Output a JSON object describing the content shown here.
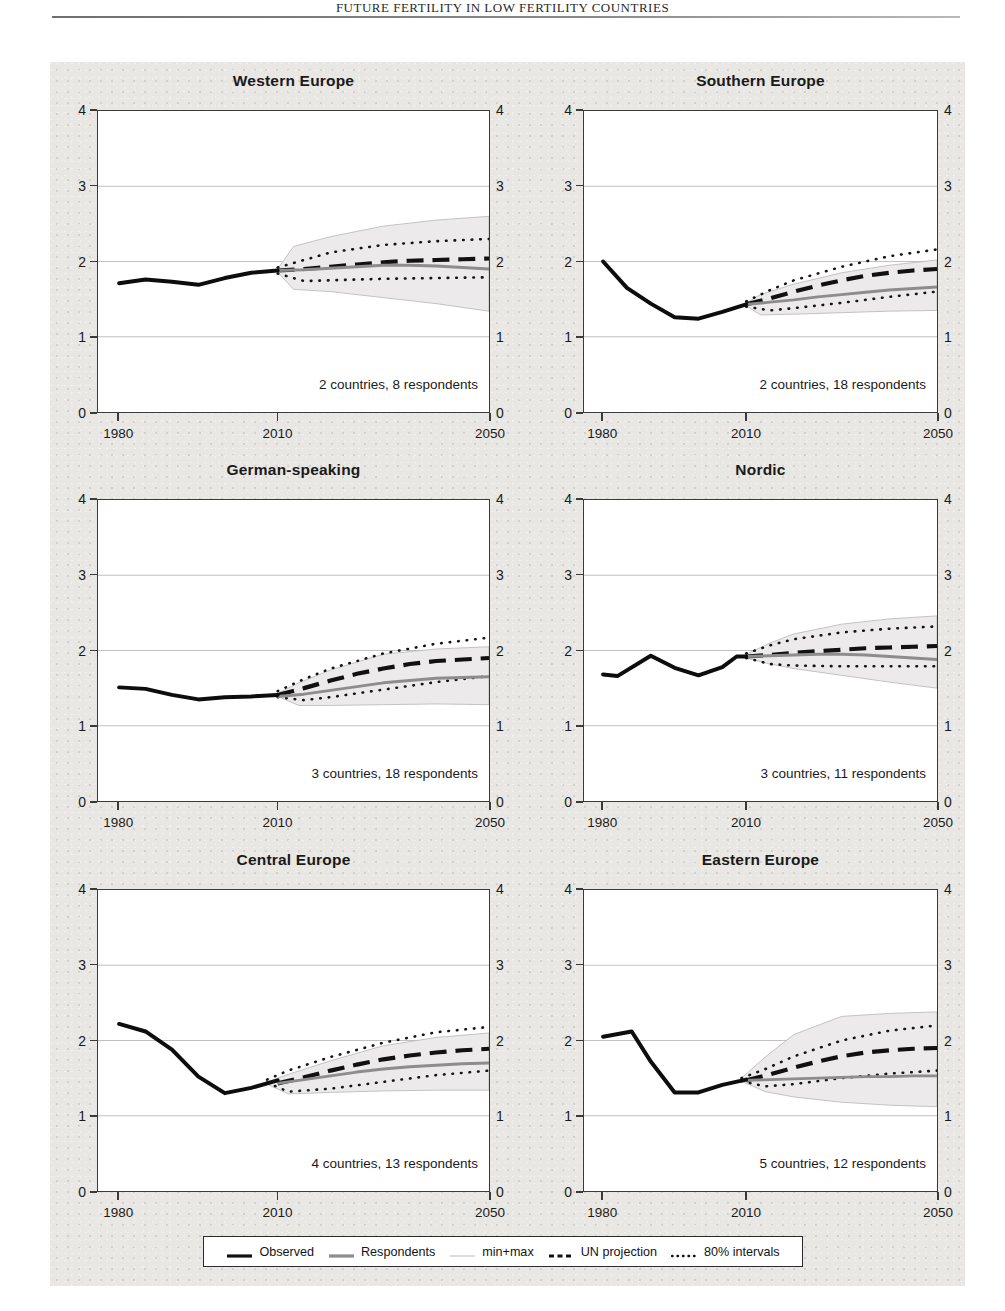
{
  "running_head": "FUTURE FERTILITY IN LOW FERTILITY COUNTRIES",
  "figure": {
    "background_color": "#e9e7e4",
    "plot_background": "#ffffff"
  },
  "axes": {
    "y_ticks": [
      "0",
      "1",
      "2",
      "3",
      "4"
    ],
    "y_values": [
      0,
      1,
      2,
      3,
      4
    ],
    "ylim": [
      0,
      4
    ],
    "x_ticks": [
      "1980",
      "2010",
      "2050"
    ],
    "x_values": [
      1980,
      2010,
      2050
    ],
    "xlim": [
      1976,
      2050
    ]
  },
  "legend": {
    "items": [
      {
        "label": "Observed",
        "key": "solid-thick-black",
        "color": "#111111"
      },
      {
        "label": "Respondents",
        "key": "solid-thick-gray",
        "color": "#8d8d8d"
      },
      {
        "label": "min+max",
        "key": "solid-thin-gray",
        "color": "#b9b9b9"
      },
      {
        "label": "UN projection",
        "key": "dashed-black",
        "color": "#111111"
      },
      {
        "label": "80% intervals",
        "key": "dotted-black",
        "color": "#111111"
      }
    ]
  },
  "chart_data": {
    "type": "line",
    "title": "",
    "xlabel": "",
    "ylabel": "",
    "xlim": [
      1976,
      2050
    ],
    "ylim": [
      0,
      4
    ],
    "grid": "horizontal gridlines at y = 1, 2, 3",
    "legend_position": "bottom-center",
    "panel_layout": "3 rows x 2 columns",
    "series_names": [
      "Observed",
      "Respondents",
      "min+max",
      "UN projection",
      "80% intervals"
    ],
    "panels": [
      {
        "title": "Western Europe",
        "annotation": "2 countries, 8 respondents",
        "countries": 2,
        "respondents": 8,
        "observed": {
          "x": [
            1980,
            1985,
            1990,
            1995,
            2000,
            2005,
            2010
          ],
          "y": [
            1.71,
            1.76,
            1.73,
            1.69,
            1.78,
            1.85,
            1.88
          ]
        },
        "respondents_median": {
          "x": [
            2010,
            2015,
            2020,
            2025,
            2030,
            2035,
            2040,
            2045,
            2050
          ],
          "y": [
            1.88,
            1.89,
            1.91,
            1.93,
            1.95,
            1.95,
            1.94,
            1.92,
            1.9
          ]
        },
        "un_projection": {
          "x": [
            2010,
            2015,
            2020,
            2025,
            2030,
            2035,
            2040,
            2045,
            2050
          ],
          "y": [
            1.88,
            1.9,
            1.93,
            1.96,
            1.99,
            2.01,
            2.02,
            2.03,
            2.04
          ]
        },
        "min": {
          "x": [
            2010,
            2013,
            2020,
            2030,
            2040,
            2050
          ],
          "y": [
            1.86,
            1.63,
            1.6,
            1.52,
            1.44,
            1.34
          ]
        },
        "max": {
          "x": [
            2010,
            2013,
            2020,
            2030,
            2040,
            2050
          ],
          "y": [
            1.9,
            2.2,
            2.33,
            2.47,
            2.55,
            2.6
          ]
        },
        "pi80_low": {
          "x": [
            2010,
            2015,
            2020,
            2030,
            2040,
            2050
          ],
          "y": [
            1.84,
            1.74,
            1.75,
            1.77,
            1.78,
            1.79
          ]
        },
        "pi80_high": {
          "x": [
            2010,
            2015,
            2020,
            2030,
            2040,
            2050
          ],
          "y": [
            1.92,
            2.02,
            2.12,
            2.22,
            2.27,
            2.3
          ]
        }
      },
      {
        "title": "Southern Europe",
        "annotation": "2 countries, 18 respondents",
        "countries": 2,
        "respondents": 18,
        "observed": {
          "x": [
            1980,
            1985,
            1990,
            1995,
            2000,
            2005,
            2010
          ],
          "y": [
            2.0,
            1.65,
            1.44,
            1.26,
            1.24,
            1.33,
            1.43
          ]
        },
        "respondents_median": {
          "x": [
            2010,
            2015,
            2020,
            2025,
            2030,
            2035,
            2040,
            2045,
            2050
          ],
          "y": [
            1.43,
            1.46,
            1.49,
            1.53,
            1.56,
            1.59,
            1.62,
            1.64,
            1.66
          ]
        },
        "un_projection": {
          "x": [
            2010,
            2015,
            2020,
            2025,
            2030,
            2035,
            2040,
            2045,
            2050
          ],
          "y": [
            1.43,
            1.51,
            1.6,
            1.68,
            1.75,
            1.81,
            1.85,
            1.88,
            1.9
          ]
        },
        "min": {
          "x": [
            2010,
            2013,
            2020,
            2030,
            2040,
            2050
          ],
          "y": [
            1.41,
            1.29,
            1.3,
            1.32,
            1.34,
            1.35
          ]
        },
        "max": {
          "x": [
            2010,
            2013,
            2020,
            2030,
            2040,
            2050
          ],
          "y": [
            1.45,
            1.56,
            1.7,
            1.85,
            1.95,
            2.02
          ]
        },
        "pi80_low": {
          "x": [
            2010,
            2015,
            2020,
            2030,
            2040,
            2050
          ],
          "y": [
            1.4,
            1.35,
            1.38,
            1.45,
            1.53,
            1.6
          ]
        },
        "pi80_high": {
          "x": [
            2010,
            2015,
            2020,
            2030,
            2040,
            2050
          ],
          "y": [
            1.47,
            1.62,
            1.75,
            1.93,
            2.07,
            2.16
          ]
        }
      },
      {
        "title": "German-speaking",
        "annotation": "3 countries, 18 respondents",
        "countries": 3,
        "respondents": 18,
        "observed": {
          "x": [
            1980,
            1985,
            1990,
            1995,
            2000,
            2005,
            2010
          ],
          "y": [
            1.51,
            1.49,
            1.41,
            1.35,
            1.38,
            1.39,
            1.41
          ]
        },
        "respondents_median": {
          "x": [
            2010,
            2015,
            2020,
            2025,
            2030,
            2035,
            2040,
            2045,
            2050
          ],
          "y": [
            1.39,
            1.42,
            1.47,
            1.52,
            1.57,
            1.6,
            1.63,
            1.64,
            1.65
          ]
        },
        "un_projection": {
          "x": [
            2010,
            2015,
            2020,
            2025,
            2030,
            2035,
            2040,
            2045,
            2050
          ],
          "y": [
            1.41,
            1.5,
            1.6,
            1.69,
            1.76,
            1.82,
            1.86,
            1.88,
            1.9
          ]
        },
        "min": {
          "x": [
            2010,
            2014,
            2020,
            2030,
            2040,
            2050
          ],
          "y": [
            1.39,
            1.27,
            1.27,
            1.28,
            1.29,
            1.28
          ]
        },
        "max": {
          "x": [
            2010,
            2014,
            2020,
            2030,
            2040,
            2050
          ],
          "y": [
            1.43,
            1.57,
            1.74,
            1.95,
            2.02,
            2.05
          ]
        },
        "pi80_low": {
          "x": [
            2010,
            2015,
            2020,
            2030,
            2040,
            2050
          ],
          "y": [
            1.38,
            1.34,
            1.38,
            1.48,
            1.58,
            1.66
          ]
        },
        "pi80_high": {
          "x": [
            2010,
            2015,
            2020,
            2030,
            2040,
            2050
          ],
          "y": [
            1.46,
            1.62,
            1.76,
            1.96,
            2.09,
            2.17
          ]
        }
      },
      {
        "title": "Nordic",
        "annotation": "3 countries, 11 respondents",
        "countries": 3,
        "respondents": 11,
        "observed": {
          "x": [
            1980,
            1983,
            1990,
            1995,
            2000,
            2005,
            2008,
            2010
          ],
          "y": [
            1.68,
            1.66,
            1.93,
            1.77,
            1.67,
            1.78,
            1.92,
            1.92
          ]
        },
        "respondents_median": {
          "x": [
            2010,
            2015,
            2020,
            2025,
            2030,
            2035,
            2040,
            2045,
            2050
          ],
          "y": [
            1.92,
            1.93,
            1.94,
            1.95,
            1.95,
            1.94,
            1.92,
            1.9,
            1.88
          ]
        },
        "un_projection": {
          "x": [
            2010,
            2015,
            2020,
            2025,
            2030,
            2035,
            2040,
            2045,
            2050
          ],
          "y": [
            1.92,
            1.94,
            1.97,
            1.99,
            2.01,
            2.03,
            2.04,
            2.05,
            2.06
          ]
        },
        "min": {
          "x": [
            2010,
            2015,
            2020,
            2030,
            2040,
            2050
          ],
          "y": [
            1.9,
            1.82,
            1.76,
            1.67,
            1.58,
            1.5
          ]
        },
        "max": {
          "x": [
            2010,
            2015,
            2020,
            2030,
            2040,
            2050
          ],
          "y": [
            1.95,
            2.1,
            2.22,
            2.35,
            2.42,
            2.46
          ]
        },
        "pi80_low": {
          "x": [
            2010,
            2015,
            2020,
            2030,
            2040,
            2050
          ],
          "y": [
            1.9,
            1.82,
            1.8,
            1.79,
            1.79,
            1.79
          ]
        },
        "pi80_high": {
          "x": [
            2010,
            2015,
            2020,
            2030,
            2040,
            2050
          ],
          "y": [
            1.96,
            2.07,
            2.15,
            2.24,
            2.29,
            2.32
          ]
        }
      },
      {
        "title": "Central Europe",
        "annotation": "4 countries, 13 respondents",
        "countries": 4,
        "respondents": 13,
        "observed": {
          "x": [
            1980,
            1985,
            1990,
            1995,
            2000,
            2005,
            2010
          ],
          "y": [
            2.22,
            2.12,
            1.88,
            1.52,
            1.3,
            1.37,
            1.47
          ]
        },
        "respondents_median": {
          "x": [
            2010,
            2015,
            2020,
            2025,
            2030,
            2035,
            2040,
            2045,
            2050
          ],
          "y": [
            1.43,
            1.48,
            1.53,
            1.58,
            1.62,
            1.65,
            1.67,
            1.69,
            1.7
          ]
        },
        "un_projection": {
          "x": [
            2010,
            2015,
            2020,
            2025,
            2030,
            2035,
            2040,
            2045,
            2050
          ],
          "y": [
            1.43,
            1.51,
            1.6,
            1.68,
            1.75,
            1.8,
            1.84,
            1.87,
            1.89
          ]
        },
        "min": {
          "x": [
            2008,
            2012,
            2020,
            2030,
            2040,
            2050
          ],
          "y": [
            1.42,
            1.29,
            1.31,
            1.33,
            1.34,
            1.34
          ]
        },
        "max": {
          "x": [
            2008,
            2012,
            2020,
            2030,
            2040,
            2050
          ],
          "y": [
            1.45,
            1.55,
            1.73,
            1.93,
            2.04,
            2.1
          ]
        },
        "pi80_low": {
          "x": [
            2008,
            2012,
            2020,
            2030,
            2040,
            2050
          ],
          "y": [
            1.44,
            1.32,
            1.36,
            1.45,
            1.54,
            1.6
          ]
        },
        "pi80_high": {
          "x": [
            2008,
            2012,
            2020,
            2030,
            2040,
            2050
          ],
          "y": [
            1.48,
            1.6,
            1.78,
            1.97,
            2.11,
            2.18
          ]
        }
      },
      {
        "title": "Eastern Europe",
        "annotation": "5 countries, 12 respondents",
        "countries": 5,
        "respondents": 12,
        "observed": {
          "x": [
            1980,
            1986,
            1990,
            1995,
            2000,
            2005,
            2010
          ],
          "y": [
            2.05,
            2.12,
            1.72,
            1.31,
            1.31,
            1.41,
            1.48
          ]
        },
        "respondents_median": {
          "x": [
            2010,
            2015,
            2020,
            2025,
            2030,
            2035,
            2040,
            2045,
            2050
          ],
          "y": [
            1.47,
            1.48,
            1.49,
            1.5,
            1.51,
            1.52,
            1.52,
            1.53,
            1.53
          ]
        },
        "un_projection": {
          "x": [
            2010,
            2015,
            2020,
            2025,
            2030,
            2035,
            2040,
            2045,
            2050
          ],
          "y": [
            1.47,
            1.55,
            1.64,
            1.72,
            1.79,
            1.84,
            1.87,
            1.89,
            1.9
          ]
        },
        "min": {
          "x": [
            2009,
            2014,
            2020,
            2030,
            2040,
            2050
          ],
          "y": [
            1.46,
            1.32,
            1.25,
            1.18,
            1.14,
            1.12
          ]
        },
        "max": {
          "x": [
            2009,
            2014,
            2020,
            2030,
            2040,
            2050
          ],
          "y": [
            1.5,
            1.78,
            2.08,
            2.32,
            2.36,
            2.38
          ]
        },
        "pi80_low": {
          "x": [
            2009,
            2014,
            2020,
            2030,
            2040,
            2050
          ],
          "y": [
            1.46,
            1.39,
            1.42,
            1.5,
            1.56,
            1.6
          ]
        },
        "pi80_high": {
          "x": [
            2009,
            2014,
            2020,
            2030,
            2040,
            2050
          ],
          "y": [
            1.5,
            1.62,
            1.79,
            2.0,
            2.13,
            2.2
          ]
        }
      }
    ]
  }
}
